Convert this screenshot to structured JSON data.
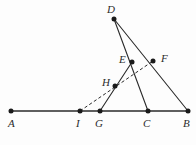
{
  "figure": {
    "width": 196,
    "height": 145,
    "background_color": "#fdfdfd",
    "stroke_color": "#2a2a2a",
    "baseline_color": "#5f5f5f",
    "vertex_color": "#1a1a1a",
    "label_color": "#2b2b2b"
  },
  "points": [
    {
      "id": "A",
      "label": "A",
      "x": 11,
      "y": 111,
      "label_x": 8,
      "label_y": 118,
      "on_baseline": true
    },
    {
      "id": "I",
      "label": "I",
      "x": 80,
      "y": 111,
      "label_x": 76,
      "label_y": 118,
      "on_baseline": true
    },
    {
      "id": "G",
      "label": "G",
      "x": 100,
      "y": 111,
      "label_x": 95,
      "label_y": 118,
      "on_baseline": true
    },
    {
      "id": "C",
      "label": "C",
      "x": 148,
      "y": 111,
      "label_x": 143,
      "label_y": 118,
      "on_baseline": true
    },
    {
      "id": "B",
      "label": "B",
      "x": 188,
      "y": 111,
      "label_x": 183,
      "label_y": 118,
      "on_baseline": true
    },
    {
      "id": "D",
      "label": "D",
      "x": 114,
      "y": 19,
      "label_x": 107,
      "label_y": 4,
      "on_baseline": false
    },
    {
      "id": "E",
      "label": "E",
      "x": 132,
      "y": 62,
      "label_x": 119,
      "label_y": 54,
      "on_baseline": false
    },
    {
      "id": "F",
      "label": "F",
      "x": 153,
      "y": 61,
      "label_x": 161,
      "label_y": 53,
      "on_baseline": false
    },
    {
      "id": "H",
      "label": "H",
      "x": 115,
      "y": 86,
      "label_x": 102,
      "label_y": 77,
      "on_baseline": false
    }
  ],
  "segments": [
    {
      "id": "baseline-AB",
      "from": "A",
      "to": "B",
      "style": "base",
      "description": "base line A to B"
    },
    {
      "id": "D-to-C",
      "from": "D",
      "to": "C",
      "style": "solid",
      "description": "cevian D through E to C"
    },
    {
      "id": "D-to-B",
      "from": "D",
      "to": "B",
      "style": "solid",
      "description": "cevian D through F to B"
    },
    {
      "id": "G-to-E",
      "from": "G",
      "to": "E",
      "style": "solid",
      "description": "segment G through H to E"
    },
    {
      "id": "I-to-F",
      "from": "I",
      "to": "F",
      "style": "dashed",
      "description": "dashed segment I through H to F"
    }
  ]
}
